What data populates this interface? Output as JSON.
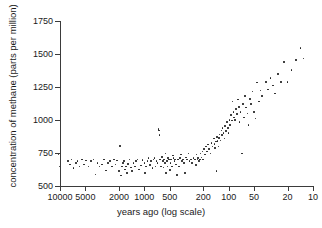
{
  "chart_data": {
    "type": "scatter",
    "title": "",
    "xlabel": "years ago (log scale)",
    "ylabel": "concentration of methane (parts per million)",
    "x_scale": "log",
    "x_reversed": true,
    "xlim": [
      10000,
      10
    ],
    "ylim": [
      500,
      1750
    ],
    "grid": false,
    "legend": null,
    "xticks": [
      10000,
      5000,
      2000,
      1000,
      500,
      200,
      100,
      50,
      20,
      10
    ],
    "xtick_labels": [
      "10000",
      "5000",
      "2000",
      "1000",
      "500",
      "200",
      "100",
      "50",
      "20",
      "10"
    ],
    "yticks": [
      500,
      750,
      1000,
      1250,
      1500,
      1750
    ],
    "ytick_labels": [
      "500",
      "750",
      "1000",
      "1250",
      "1500",
      "1750"
    ],
    "marker": "dot",
    "marker_color": "#1a1a1a",
    "series": [
      {
        "name": "methane concentration",
        "points": [
          [
            10400,
            740
          ],
          [
            10100,
            648
          ],
          [
            8100,
            690
          ],
          [
            7600,
            663
          ],
          [
            7300,
            700
          ],
          [
            6900,
            638
          ],
          [
            6500,
            676
          ],
          [
            6200,
            690
          ],
          [
            5900,
            648
          ],
          [
            5500,
            700
          ],
          [
            5200,
            662
          ],
          [
            4900,
            692
          ],
          [
            4600,
            648
          ],
          [
            4300,
            690
          ],
          [
            4000,
            700
          ],
          [
            3800,
            586
          ],
          [
            3600,
            672
          ],
          [
            3400,
            648
          ],
          [
            3200,
            664
          ],
          [
            3000,
            700
          ],
          [
            2850,
            618
          ],
          [
            2700,
            676
          ],
          [
            2550,
            690
          ],
          [
            2400,
            648
          ],
          [
            2300,
            700
          ],
          [
            2200,
            663
          ],
          [
            2100,
            692
          ],
          [
            2000,
            612
          ],
          [
            1950,
            805
          ],
          [
            1900,
            580
          ],
          [
            1850,
            648
          ],
          [
            1800,
            676
          ],
          [
            1750,
            690
          ],
          [
            1700,
            625
          ],
          [
            1650,
            648
          ],
          [
            1600,
            600
          ],
          [
            1550,
            668
          ],
          [
            1500,
            700
          ],
          [
            1450,
            640
          ],
          [
            1400,
            612
          ],
          [
            1350,
            676
          ],
          [
            1300,
            648
          ],
          [
            1250,
            690
          ],
          [
            1200,
            700
          ],
          [
            1150,
            625
          ],
          [
            1100,
            655
          ],
          [
            1050,
            698
          ],
          [
            1000,
            672
          ],
          [
            980,
            600
          ],
          [
            950,
            648
          ],
          [
            920,
            690
          ],
          [
            890,
            712
          ],
          [
            860,
            660
          ],
          [
            830,
            688
          ],
          [
            800,
            637
          ],
          [
            780,
            700
          ],
          [
            760,
            712
          ],
          [
            740,
            648
          ],
          [
            720,
            690
          ],
          [
            700,
            672
          ],
          [
            680,
            930
          ],
          [
            670,
            920
          ],
          [
            660,
            885
          ],
          [
            650,
            700
          ],
          [
            630,
            648
          ],
          [
            620,
            718
          ],
          [
            600,
            690
          ],
          [
            590,
            640
          ],
          [
            580,
            700
          ],
          [
            570,
            672
          ],
          [
            560,
            745
          ],
          [
            550,
            600
          ],
          [
            540,
            690
          ],
          [
            530,
            648
          ],
          [
            520,
            712
          ],
          [
            510,
            700
          ],
          [
            500,
            620
          ],
          [
            490,
            676
          ],
          [
            480,
            700
          ],
          [
            470,
            648
          ],
          [
            460,
            730
          ],
          [
            450,
            712
          ],
          [
            440,
            688
          ],
          [
            430,
            700
          ],
          [
            420,
            663
          ],
          [
            410,
            585
          ],
          [
            400,
            700
          ],
          [
            390,
            648
          ],
          [
            380,
            712
          ],
          [
            370,
            740
          ],
          [
            360,
            690
          ],
          [
            350,
            700
          ],
          [
            340,
            672
          ],
          [
            330,
            600
          ],
          [
            320,
            715
          ],
          [
            310,
            700
          ],
          [
            300,
            745
          ],
          [
            290,
            690
          ],
          [
            280,
            700
          ],
          [
            270,
            672
          ],
          [
            260,
            712
          ],
          [
            250,
            700
          ],
          [
            245,
            660
          ],
          [
            240,
            738
          ],
          [
            235,
            700
          ],
          [
            230,
            712
          ],
          [
            225,
            688
          ],
          [
            220,
            700
          ],
          [
            215,
            745
          ],
          [
            210,
            715
          ],
          [
            205,
            760
          ],
          [
            200,
            700
          ],
          [
            195,
            782
          ],
          [
            190,
            738
          ],
          [
            185,
            800
          ],
          [
            180,
            760
          ],
          [
            175,
            815
          ],
          [
            170,
            782
          ],
          [
            165,
            745
          ],
          [
            160,
            825
          ],
          [
            155,
            800
          ],
          [
            150,
            860
          ],
          [
            148,
            818
          ],
          [
            145,
            790
          ],
          [
            142,
            838
          ],
          [
            140,
            612
          ],
          [
            138,
            870
          ],
          [
            135,
            840
          ],
          [
            132,
            800
          ],
          [
            130,
            862
          ],
          [
            128,
            890
          ],
          [
            125,
            845
          ],
          [
            122,
            920
          ],
          [
            120,
            888
          ],
          [
            118,
            940
          ],
          [
            115,
            900
          ],
          [
            112,
            860
          ],
          [
            110,
            955
          ],
          [
            108,
            918
          ],
          [
            105,
            985
          ],
          [
            102,
            940
          ],
          [
            100,
            900
          ],
          [
            98,
            1000
          ],
          [
            96,
            962
          ],
          [
            94,
            1040
          ],
          [
            92,
            995
          ],
          [
            90,
            1140
          ],
          [
            88,
            1060
          ],
          [
            86,
            1020
          ],
          [
            84,
            1000
          ],
          [
            82,
            1085
          ],
          [
            80,
            1045
          ],
          [
            78,
            1155
          ],
          [
            76,
            1100
          ],
          [
            74,
            985
          ],
          [
            72,
            1060
          ],
          [
            70,
            745
          ],
          [
            68,
            1120
          ],
          [
            66,
            1020
          ],
          [
            64,
            1180
          ],
          [
            62,
            1095
          ],
          [
            60,
            1050
          ],
          [
            58,
            960
          ],
          [
            56,
            1160
          ],
          [
            54,
            1120
          ],
          [
            52,
            1215
          ],
          [
            50,
            1060
          ],
          [
            48,
            1010
          ],
          [
            46,
            1285
          ],
          [
            44,
            1140
          ],
          [
            42,
            1225
          ],
          [
            40,
            1180
          ],
          [
            36,
            1290
          ],
          [
            34,
            1230
          ],
          [
            32,
            1320
          ],
          [
            30,
            1262
          ],
          [
            28,
            1200
          ],
          [
            26,
            1350
          ],
          [
            24,
            1290
          ],
          [
            22,
            1440
          ],
          [
            20,
            1290
          ],
          [
            18,
            1380
          ],
          [
            16,
            1455
          ],
          [
            14,
            1545
          ],
          [
            13,
            1465
          ]
        ]
      }
    ]
  }
}
